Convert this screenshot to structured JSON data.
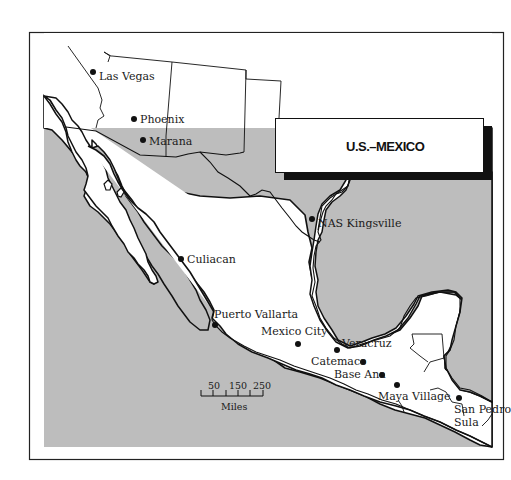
{
  "map": {
    "title": "U.S.–MEXICO",
    "colors": {
      "water": "#bdbdbd",
      "land": "#ffffff",
      "outline": "#111111",
      "title_shadow": "#111111"
    },
    "cities": [
      {
        "name": "Las Vegas",
        "label": "Las Vegas"
      },
      {
        "name": "Phoenix",
        "label": "Phoenix"
      },
      {
        "name": "Marana",
        "label": "Marana"
      },
      {
        "name": "NAS Kingsville",
        "label": "NAS Kingsville"
      },
      {
        "name": "Culiacan",
        "label": "Culiacan"
      },
      {
        "name": "Puerto Vallarta",
        "label": "Puerto Vallarta"
      },
      {
        "name": "Mexico City",
        "label": "Mexico City"
      },
      {
        "name": "Veracruz",
        "label": "Veracruz"
      },
      {
        "name": "Catemaco",
        "label": "Catemaco"
      },
      {
        "name": "Base Ana",
        "label": "Base Ana"
      },
      {
        "name": "Maya Village",
        "label": "Maya Village"
      },
      {
        "name": "San Pedro Sula",
        "label_line1": "San Pedro",
        "label_line2": "Sula"
      }
    ],
    "scale_bar": {
      "ticks": [
        "50",
        "150",
        "250"
      ],
      "unit": "Miles"
    }
  }
}
